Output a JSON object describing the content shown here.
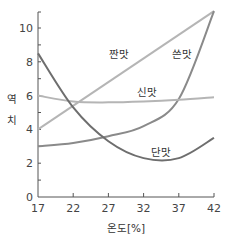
{
  "chart_data": {
    "type": "line",
    "title": "",
    "xlabel": "온도[%]",
    "ylabel": "역치",
    "xlim": [
      17,
      42
    ],
    "ylim": [
      0,
      11
    ],
    "x_ticks": [
      "17",
      "22",
      "27",
      "32",
      "37",
      "42"
    ],
    "y_ticks": [
      "0",
      "2",
      "4",
      "6",
      "8",
      "10"
    ],
    "grid": false,
    "legend": "inline labels",
    "x": [
      17,
      22,
      27,
      32,
      37,
      42
    ],
    "series": [
      {
        "name": "짠맛",
        "values": [
          4.0,
          5.4,
          6.8,
          8.2,
          9.6,
          11.0
        ],
        "color": "#b5b5b5"
      },
      {
        "name": "쓴맛",
        "values": [
          3.0,
          3.2,
          3.6,
          4.2,
          5.8,
          11.0
        ],
        "color": "#8a8a8a"
      },
      {
        "name": "신맛",
        "values": [
          6.0,
          5.65,
          5.6,
          5.65,
          5.75,
          5.9
        ],
        "color": "#b5b5b5"
      },
      {
        "name": "단맛",
        "values": [
          8.5,
          5.3,
          3.3,
          2.3,
          2.3,
          3.5
        ],
        "color": "#6e6e6e"
      }
    ],
    "annotations": [
      {
        "text": "짠맛",
        "x": 28.5,
        "y": 8.2
      },
      {
        "text": "쓴맛",
        "x": 37.5,
        "y": 8.2
      },
      {
        "text": "신맛",
        "x": 32.5,
        "y": 6.0
      },
      {
        "text": "단맛",
        "x": 34.5,
        "y": 2.4
      }
    ]
  }
}
